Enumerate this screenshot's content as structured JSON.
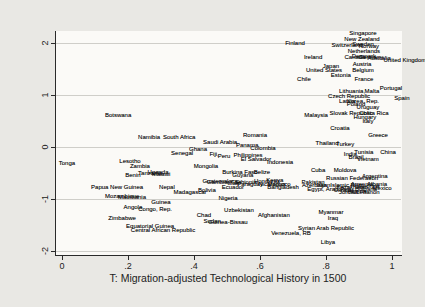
{
  "figure": {
    "background": "#e9e8e4",
    "plot_background": "#fbfaf7",
    "text_color": "#1c1c1c",
    "grid_color": "#cfcec9"
  },
  "chart_data": {
    "type": "scatter",
    "title": "",
    "xlabel": "T: Migration-adjusted Technological History in 1500",
    "ylabel": "Average of 4 World Bank Governance Indicators",
    "marker": "text-labels-only",
    "grid": "horizontal",
    "legend": "none",
    "xlim": [
      -0.0212,
      1.0273
    ],
    "ylim": [
      -2.077,
      2.212
    ],
    "x_ticks": [
      {
        "value": 0.0,
        "label": "0"
      },
      {
        "value": 0.2,
        "label": ".2"
      },
      {
        "value": 0.4,
        "label": ".4"
      },
      {
        "value": 0.6,
        "label": ".6"
      },
      {
        "value": 0.8,
        "label": ".8"
      },
      {
        "value": 1.0,
        "label": "1"
      }
    ],
    "y_ticks": [
      {
        "value": 2,
        "label": "2"
      },
      {
        "value": 1,
        "label": "1"
      },
      {
        "value": 0,
        "label": "0"
      },
      {
        "value": -1,
        "label": "-1"
      },
      {
        "value": -2,
        "label": "-2"
      }
    ],
    "points": [
      {
        "label": "Singapore",
        "x": 0.912,
        "y": 2.192
      },
      {
        "label": "New Zealand",
        "x": 0.909,
        "y": 2.077
      },
      {
        "label": "Finland",
        "x": 0.706,
        "y": 2.0
      },
      {
        "label": "Switzerland",
        "x": 0.864,
        "y": 1.962
      },
      {
        "label": "Sweden",
        "x": 0.912,
        "y": 1.981
      },
      {
        "label": "Norway",
        "x": 0.93,
        "y": 1.942
      },
      {
        "label": "Netherlands",
        "x": 0.915,
        "y": 1.846
      },
      {
        "label": "Denmark",
        "x": 0.915,
        "y": 1.75
      },
      {
        "label": "Canada",
        "x": 0.888,
        "y": 1.731
      },
      {
        "label": "Germany",
        "x": 0.936,
        "y": 1.731
      },
      {
        "label": "Australia",
        "x": 0.961,
        "y": 1.712
      },
      {
        "label": "United Kingdom",
        "x": 1.039,
        "y": 1.673
      },
      {
        "label": "Ireland",
        "x": 0.761,
        "y": 1.731
      },
      {
        "label": "Austria",
        "x": 0.909,
        "y": 1.596
      },
      {
        "label": "Japan",
        "x": 0.815,
        "y": 1.558
      },
      {
        "label": "United States",
        "x": 0.794,
        "y": 1.481
      },
      {
        "label": "Belgium",
        "x": 0.912,
        "y": 1.481
      },
      {
        "label": "Estonia",
        "x": 0.845,
        "y": 1.385
      },
      {
        "label": "Chile",
        "x": 0.733,
        "y": 1.308
      },
      {
        "label": "France",
        "x": 0.915,
        "y": 1.308
      },
      {
        "label": "Portugal",
        "x": 0.997,
        "y": 1.135
      },
      {
        "label": "Lithuania,",
        "x": 0.879,
        "y": 1.077
      },
      {
        "label": "Malta",
        "x": 0.939,
        "y": 1.077
      },
      {
        "label": "Czech Republic",
        "x": 0.87,
        "y": 0.981
      },
      {
        "label": "Spain",
        "x": 1.03,
        "y": 0.942
      },
      {
        "label": "Latvia",
        "x": 0.864,
        "y": 0.885
      },
      {
        "label": "Korea, Rep.",
        "x": 0.912,
        "y": 0.885
      },
      {
        "label": "Poland",
        "x": 0.891,
        "y": 0.827
      },
      {
        "label": "Uruguay",
        "x": 0.927,
        "y": 0.769
      },
      {
        "label": "Malaysia",
        "x": 0.77,
        "y": 0.615
      },
      {
        "label": "Slovak Republic",
        "x": 0.876,
        "y": 0.654
      },
      {
        "label": "Costa Rica",
        "x": 0.945,
        "y": 0.654
      },
      {
        "label": "Hungary",
        "x": 0.918,
        "y": 0.577
      },
      {
        "label": "Italy",
        "x": 0.927,
        "y": 0.5
      },
      {
        "label": "Botswana",
        "x": 0.17,
        "y": 0.615
      },
      {
        "label": "Croatia",
        "x": 0.842,
        "y": 0.365
      },
      {
        "label": "Greece",
        "x": 0.958,
        "y": 0.231
      },
      {
        "label": "Romania",
        "x": 0.585,
        "y": 0.231
      },
      {
        "label": "Namibia",
        "x": 0.264,
        "y": 0.192
      },
      {
        "label": "South Africa",
        "x": 0.355,
        "y": 0.192
      },
      {
        "label": "Saudi Arabia",
        "x": 0.479,
        "y": 0.096
      },
      {
        "label": "Thailand",
        "x": 0.803,
        "y": 0.077
      },
      {
        "label": "Turkey",
        "x": 0.858,
        "y": 0.058
      },
      {
        "label": "Panama",
        "x": 0.561,
        "y": 0.038
      },
      {
        "label": "Ghana",
        "x": 0.412,
        "y": -0.038
      },
      {
        "label": "Colombia",
        "x": 0.609,
        "y": -0.019
      },
      {
        "label": "Senegal",
        "x": 0.364,
        "y": -0.115
      },
      {
        "label": "Fiji,",
        "x": 0.461,
        "y": -0.135
      },
      {
        "label": "Peru",
        "x": 0.491,
        "y": -0.173
      },
      {
        "label": "China",
        "x": 0.988,
        "y": -0.096
      },
      {
        "label": "Tunisia",
        "x": 0.915,
        "y": -0.096
      },
      {
        "label": "India,",
        "x": 0.876,
        "y": -0.135
      },
      {
        "label": "Brazil",
        "x": 0.891,
        "y": -0.192
      },
      {
        "label": "Vietnam",
        "x": 0.927,
        "y": -0.231
      },
      {
        "label": "Philippines",
        "x": 0.564,
        "y": -0.154
      },
      {
        "label": "El Salvador",
        "x": 0.588,
        "y": -0.231
      },
      {
        "label": "Indonesia",
        "x": 0.661,
        "y": -0.288
      },
      {
        "label": "Tonga",
        "x": 0.015,
        "y": -0.308
      },
      {
        "label": "Lesotho",
        "x": 0.206,
        "y": -0.269
      },
      {
        "label": "Zambia",
        "x": 0.236,
        "y": -0.365
      },
      {
        "label": "Mongolia",
        "x": 0.436,
        "y": -0.365
      },
      {
        "label": "Cuba",
        "x": 0.776,
        "y": -0.442
      },
      {
        "label": "Moldova",
        "x": 0.858,
        "y": -0.442
      },
      {
        "label": "Benin",
        "x": 0.215,
        "y": -0.538
      },
      {
        "label": "Tanzania",
        "x": 0.267,
        "y": -0.5
      },
      {
        "label": "Malawi",
        "x": 0.3,
        "y": -0.519
      },
      {
        "label": "Uganda",
        "x": 0.291,
        "y": -0.481
      },
      {
        "label": "Burkina Faso",
        "x": 0.539,
        "y": -0.481
      },
      {
        "label": "Guyana",
        "x": 0.548,
        "y": -0.538
      },
      {
        "label": "Belize",
        "x": 0.606,
        "y": -0.481
      },
      {
        "label": "Russian Federation",
        "x": 0.879,
        "y": -0.596
      },
      {
        "label": "Argentina",
        "x": 0.948,
        "y": -0.558
      },
      {
        "label": "Guatemala",
        "x": 0.47,
        "y": -0.654
      },
      {
        "label": "Gambia, The",
        "x": 0.491,
        "y": -0.673
      },
      {
        "label": "Mali",
        "x": 0.518,
        "y": -0.692
      },
      {
        "label": "Ethiopia",
        "x": 0.558,
        "y": -0.673
      },
      {
        "label": "Paraguay",
        "x": 0.57,
        "y": -0.712
      },
      {
        "label": "Honduras",
        "x": 0.621,
        "y": -0.654
      },
      {
        "label": "Kenya",
        "x": 0.645,
        "y": -0.635
      },
      {
        "label": "Nicaragua",
        "x": 0.636,
        "y": -0.712
      },
      {
        "label": "Morocco",
        "x": 0.658,
        "y": -0.712
      },
      {
        "label": "Pakistan",
        "x": 0.761,
        "y": -0.673
      },
      {
        "label": "Azerbaijan",
        "x": 0.77,
        "y": -0.731
      },
      {
        "label": "Egypt, Arab Rep.",
        "x": 0.812,
        "y": -0.808
      },
      {
        "label": "Iran, Islamic Rep.",
        "x": 0.842,
        "y": -0.731
      },
      {
        "label": "Kazakhstan",
        "x": 0.879,
        "y": -0.769
      },
      {
        "label": "Ukraine",
        "x": 0.855,
        "y": -0.827
      },
      {
        "label": "Armenia",
        "x": 0.909,
        "y": -0.712
      },
      {
        "label": "Georgia",
        "x": 0.93,
        "y": -0.75
      },
      {
        "label": "Albania",
        "x": 0.955,
        "y": -0.712
      },
      {
        "label": "Bulgaria",
        "x": 0.921,
        "y": -0.808
      },
      {
        "label": "Jordan",
        "x": 0.867,
        "y": -0.865
      },
      {
        "label": "Algeria",
        "x": 0.894,
        "y": -0.846
      },
      {
        "label": "Lebanon",
        "x": 0.927,
        "y": -0.865
      },
      {
        "label": "Mexico",
        "x": 0.97,
        "y": -0.788
      },
      {
        "label": "Nepal",
        "x": 0.318,
        "y": -0.769
      },
      {
        "label": "Papua New Guinea",
        "x": 0.167,
        "y": -0.769
      },
      {
        "label": "Madagascar",
        "x": 0.388,
        "y": -0.865
      },
      {
        "label": "Bolivia",
        "x": 0.439,
        "y": -0.827
      },
      {
        "label": "Ecuador",
        "x": 0.518,
        "y": -0.769
      },
      {
        "label": "Bangladesh",
        "x": 0.67,
        "y": -0.769
      },
      {
        "label": "Mozambique",
        "x": 0.182,
        "y": -0.942
      },
      {
        "label": "Mauritania",
        "x": 0.212,
        "y": -0.962
      },
      {
        "label": "Nigeria",
        "x": 0.503,
        "y": -0.981
      },
      {
        "label": "Guinea",
        "x": 0.3,
        "y": -1.058
      },
      {
        "label": "Angola",
        "x": 0.215,
        "y": -1.154
      },
      {
        "label": "Congo, Rep.",
        "x": 0.282,
        "y": -1.192
      },
      {
        "label": "Uzbekistan",
        "x": 0.536,
        "y": -1.212
      },
      {
        "label": "Myanmar",
        "x": 0.815,
        "y": -1.25
      },
      {
        "label": "Chad",
        "x": 0.43,
        "y": -1.308
      },
      {
        "label": "Afghanistan",
        "x": 0.642,
        "y": -1.308
      },
      {
        "label": "Iraq",
        "x": 0.821,
        "y": -1.365
      },
      {
        "label": "Zimbabwe",
        "x": 0.182,
        "y": -1.365
      },
      {
        "label": "Sudan",
        "x": 0.455,
        "y": -1.423
      },
      {
        "label": "Guinea-Bissau",
        "x": 0.503,
        "y": -1.442
      },
      {
        "label": "Equatorial Guinea",
        "x": 0.267,
        "y": -1.519
      },
      {
        "label": "Central African Republic",
        "x": 0.306,
        "y": -1.596
      },
      {
        "label": "Syrian Arab Republic",
        "x": 0.8,
        "y": -1.558
      },
      {
        "label": "Venezuela, RB",
        "x": 0.694,
        "y": -1.654
      },
      {
        "label": "Libya",
        "x": 0.806,
        "y": -1.827
      }
    ]
  }
}
